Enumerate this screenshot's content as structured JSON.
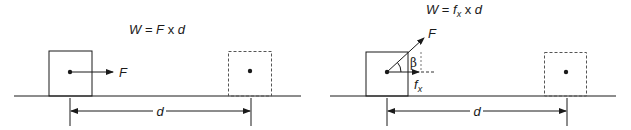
{
  "left_panel": {
    "equation": {
      "lhs": "W",
      "eq": " = ",
      "f": "F",
      "times": " x ",
      "d": "d"
    },
    "force_label": "F",
    "distance_label": "d",
    "initial_box": "solid",
    "final_box": "dashed"
  },
  "right_panel": {
    "equation": {
      "lhs": "W",
      "eq": " = ",
      "f": "f",
      "sub": "x",
      "times": " x ",
      "d": "d"
    },
    "force_label": "F",
    "component_label": "f",
    "component_sub": "x",
    "angle_label": "β",
    "distance_label": "d",
    "initial_box": "solid",
    "final_box": "dashed"
  },
  "colors": {
    "stroke": "#1a1a1a",
    "dashed": "#555555",
    "background": "#ffffff"
  }
}
